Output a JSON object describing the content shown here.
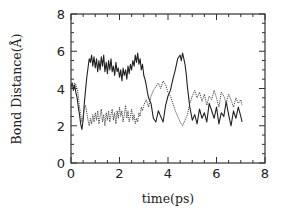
{
  "chart_data": {
    "type": "line",
    "title": "",
    "xlabel": "time(ps)",
    "ylabel": "Bond Distance(Å)",
    "xlim": [
      0,
      8
    ],
    "ylim": [
      0,
      8
    ],
    "xticks": [
      0,
      2,
      4,
      6,
      8
    ],
    "yticks": [
      0,
      2,
      4,
      6,
      8
    ],
    "x_minor_step": 0.5,
    "y_minor_step": 0.5,
    "grid": false,
    "legend": null,
    "series": [
      {
        "name": "bond-1",
        "style": "solid",
        "color": "#222222",
        "x": [
          0.0,
          0.05,
          0.1,
          0.15,
          0.2,
          0.25,
          0.3,
          0.35,
          0.4,
          0.45,
          0.5,
          0.55,
          0.6,
          0.65,
          0.7,
          0.75,
          0.8,
          0.85,
          0.9,
          0.95,
          1.0,
          1.05,
          1.1,
          1.15,
          1.2,
          1.25,
          1.3,
          1.35,
          1.4,
          1.45,
          1.5,
          1.55,
          1.6,
          1.65,
          1.7,
          1.75,
          1.8,
          1.85,
          1.9,
          1.95,
          2.0,
          2.05,
          2.1,
          2.15,
          2.2,
          2.25,
          2.3,
          2.35,
          2.4,
          2.45,
          2.5,
          2.55,
          2.6,
          2.65,
          2.7,
          2.75,
          2.8,
          2.85,
          2.9,
          2.95,
          3.0,
          3.05,
          3.1,
          3.15,
          3.2,
          3.3,
          3.4,
          3.5,
          3.6,
          3.7,
          3.8,
          3.9,
          4.0,
          4.1,
          4.2,
          4.3,
          4.4,
          4.5,
          4.55,
          4.6,
          4.65,
          4.7,
          4.75,
          4.8,
          4.9,
          5.0,
          5.1,
          5.2,
          5.3,
          5.4,
          5.5,
          5.6,
          5.7,
          5.8,
          5.9,
          6.0,
          6.1,
          6.2,
          6.3,
          6.4,
          6.5,
          6.6,
          6.7,
          6.8,
          6.9,
          7.0,
          7.05
        ],
        "y": [
          4.1,
          4.3,
          3.9,
          4.2,
          3.8,
          3.5,
          3.0,
          2.6,
          2.1,
          1.8,
          2.3,
          3.2,
          3.9,
          4.6,
          5.1,
          5.6,
          5.4,
          5.8,
          5.2,
          5.7,
          5.1,
          5.6,
          4.9,
          5.5,
          5.0,
          5.7,
          5.2,
          5.8,
          4.9,
          5.4,
          4.8,
          5.5,
          5.0,
          5.6,
          4.9,
          5.2,
          4.7,
          5.4,
          4.9,
          5.1,
          4.6,
          5.0,
          4.4,
          5.1,
          4.7,
          5.0,
          4.5,
          5.2,
          4.8,
          5.3,
          5.0,
          5.5,
          5.2,
          5.8,
          5.4,
          5.9,
          5.3,
          5.6,
          5.0,
          5.3,
          4.7,
          4.5,
          4.2,
          3.8,
          3.5,
          3.2,
          2.4,
          2.2,
          2.8,
          2.5,
          2.2,
          3.1,
          3.6,
          3.9,
          4.5,
          5.0,
          5.6,
          5.8,
          5.5,
          5.9,
          5.6,
          5.3,
          4.8,
          4.1,
          3.0,
          2.3,
          2.6,
          2.1,
          2.9,
          2.4,
          2.7,
          2.2,
          3.2,
          2.8,
          2.4,
          3.0,
          2.1,
          2.7,
          2.5,
          3.3,
          2.6,
          2.0,
          2.8,
          2.4,
          3.0,
          2.5,
          2.2
        ]
      },
      {
        "name": "bond-2",
        "style": "dotted",
        "color": "#444444",
        "x": [
          0.0,
          0.05,
          0.1,
          0.15,
          0.2,
          0.25,
          0.3,
          0.35,
          0.4,
          0.45,
          0.5,
          0.55,
          0.6,
          0.65,
          0.7,
          0.75,
          0.8,
          0.85,
          0.9,
          0.95,
          1.0,
          1.05,
          1.1,
          1.15,
          1.2,
          1.25,
          1.3,
          1.35,
          1.4,
          1.45,
          1.5,
          1.55,
          1.6,
          1.65,
          1.7,
          1.75,
          1.8,
          1.85,
          1.9,
          1.95,
          2.0,
          2.05,
          2.1,
          2.15,
          2.2,
          2.25,
          2.3,
          2.35,
          2.4,
          2.45,
          2.5,
          2.55,
          2.6,
          2.65,
          2.7,
          2.75,
          2.8,
          2.85,
          2.9,
          2.95,
          3.0,
          3.1,
          3.2,
          3.3,
          3.4,
          3.5,
          3.6,
          3.7,
          3.8,
          3.9,
          4.0,
          4.1,
          4.2,
          4.3,
          4.4,
          4.5,
          4.6,
          4.7,
          4.8,
          4.9,
          5.0,
          5.1,
          5.2,
          5.3,
          5.4,
          5.5,
          5.6,
          5.7,
          5.8,
          5.9,
          6.0,
          6.1,
          6.2,
          6.3,
          6.4,
          6.5,
          6.6,
          6.7,
          6.8,
          6.9,
          7.0,
          7.05
        ],
        "y": [
          4.0,
          4.2,
          4.1,
          4.3,
          4.2,
          4.0,
          3.6,
          3.0,
          2.6,
          2.2,
          2.5,
          2.9,
          3.1,
          2.7,
          2.3,
          2.0,
          2.4,
          2.1,
          2.6,
          2.2,
          2.7,
          2.3,
          2.8,
          2.1,
          2.5,
          2.9,
          2.2,
          2.6,
          2.0,
          2.7,
          2.3,
          2.8,
          2.2,
          2.6,
          2.9,
          2.3,
          2.7,
          2.1,
          2.8,
          2.4,
          3.0,
          2.5,
          2.8,
          2.2,
          2.6,
          3.1,
          2.4,
          2.8,
          2.2,
          2.5,
          2.9,
          2.3,
          2.6,
          2.1,
          2.4,
          2.2,
          2.7,
          2.5,
          3.0,
          2.8,
          3.1,
          3.4,
          3.0,
          3.6,
          3.9,
          4.1,
          4.3,
          4.0,
          4.4,
          4.2,
          3.8,
          3.6,
          3.2,
          2.8,
          2.5,
          2.2,
          2.0,
          2.3,
          2.6,
          3.2,
          3.6,
          3.9,
          3.5,
          3.8,
          3.3,
          3.7,
          3.1,
          3.6,
          3.4,
          3.9,
          3.5,
          3.0,
          3.8,
          3.6,
          3.2,
          3.7,
          3.4,
          3.0,
          3.5,
          3.2,
          3.4,
          3.1
        ]
      }
    ]
  }
}
